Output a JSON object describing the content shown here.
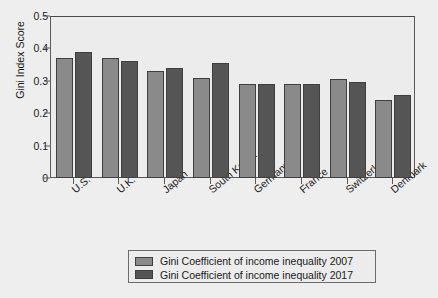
{
  "chart_data": {
    "type": "bar",
    "title": "",
    "xlabel": "",
    "ylabel": "Gini Index Score",
    "ylim": [
      0,
      0.5
    ],
    "ytick_labels": [
      "0.5",
      "0.4",
      "0.3",
      "0.2",
      "0.1",
      "0"
    ],
    "ytick_values": [
      0.5,
      0.4,
      0.3,
      0.2,
      0.1,
      0
    ],
    "grid": false,
    "legend_position": "bottom-center",
    "categories": [
      "U.S.",
      "U.K.",
      "Japan",
      "South Korea",
      "Germany",
      "France",
      "Switzerland",
      "Denmark"
    ],
    "series": [
      {
        "name": "Gini Coefficient of income inequality 2007",
        "color": "#8a8a8a",
        "values": [
          0.37,
          0.37,
          0.33,
          0.31,
          0.29,
          0.29,
          0.305,
          0.24
        ]
      },
      {
        "name": "Gini Coefficient of income inequality 2017",
        "color": "#555555",
        "values": [
          0.39,
          0.36,
          0.34,
          0.355,
          0.29,
          0.29,
          0.295,
          0.255
        ]
      }
    ]
  },
  "colors": {
    "background": "#eeeeee",
    "plot_background": "#ececec",
    "frame": "#5a5a5a",
    "series_2007": "#8a8a8a",
    "series_2017": "#555555"
  }
}
